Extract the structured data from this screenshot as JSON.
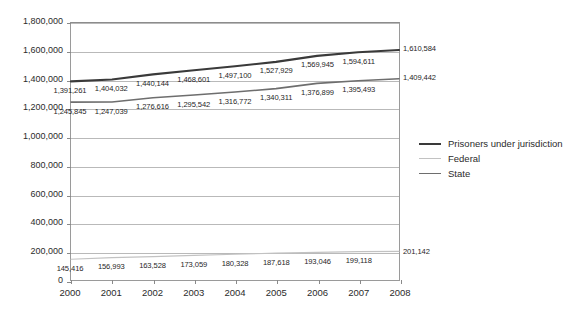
{
  "chart_data": {
    "type": "line",
    "title": "",
    "subtitle": "",
    "xlabel": "",
    "ylabel": "",
    "categories": [
      "2000",
      "2001",
      "2002",
      "2003",
      "2004",
      "2005",
      "2006",
      "2007",
      "2008"
    ],
    "x": [
      2000,
      2001,
      2002,
      2003,
      2004,
      2005,
      2006,
      2007,
      2008
    ],
    "ylim": [
      0,
      1800000
    ],
    "ytick_values": [
      0,
      200000,
      400000,
      600000,
      800000,
      1000000,
      1200000,
      1400000,
      1600000,
      1800000
    ],
    "ytick_labels": [
      "0",
      "200,000",
      "400,000",
      "600,000",
      "800,000",
      "1,000,000",
      "1,200,000",
      "1,400,000",
      "1,600,000",
      "1,800,000"
    ],
    "grid": true,
    "grid_axis": "y",
    "legend_position": "right",
    "series": [
      {
        "name": "Prisoners under jurisdiction",
        "color": "#3a3a3a",
        "width": 2.1,
        "values": [
          1391261,
          1404032,
          1440144,
          1468601,
          1497100,
          1527929,
          1569945,
          1594611,
          1610584
        ],
        "labels": [
          "1,391,261",
          "1,404,032",
          "1,440,144",
          "1,468,601",
          "1,497,100",
          "1,527,929",
          "1,569,945",
          "1,594,611",
          "1,610,584"
        ]
      },
      {
        "name": "Federal",
        "color": "#c2c2c2",
        "width": 1.2,
        "values": [
          145416,
          156993,
          163528,
          173059,
          180328,
          187618,
          193046,
          199118,
          201142
        ],
        "labels": [
          "145,416",
          "156,993",
          "163,528",
          "173,059",
          "180,328",
          "187,618",
          "193,046",
          "199,118",
          "201,142"
        ]
      },
      {
        "name": "State",
        "color": "#6e6e6e",
        "width": 1.6,
        "values": [
          1245845,
          1247039,
          1276616,
          1295542,
          1316772,
          1340311,
          1376899,
          1395493,
          1409442
        ],
        "labels": [
          "1,245,845",
          "1,247,039",
          "1,276,616",
          "1,295,542",
          "1,316,772",
          "1,340,311",
          "1,376,899",
          "1,395,493",
          "1,409,442"
        ]
      }
    ]
  },
  "legend": {
    "items": [
      {
        "label": "Prisoners under jurisdiction",
        "color": "#3a3a3a",
        "width": 2.1
      },
      {
        "label": "Federal",
        "color": "#c2c2c2",
        "width": 1.6
      },
      {
        "label": "State",
        "color": "#6e6e6e",
        "width": 1.8
      }
    ]
  },
  "colors": {
    "plot_border": "#9a9a9a",
    "gridline": "#b9b9b9",
    "text": "#2b2b2b",
    "background": "#ffffff"
  }
}
